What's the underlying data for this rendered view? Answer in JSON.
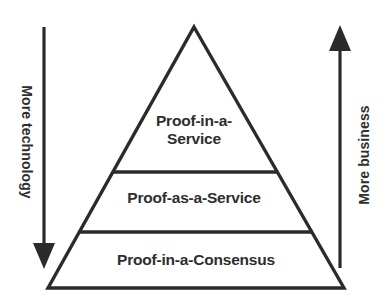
{
  "diagram": {
    "type": "pyramid",
    "background_color": "#ffffff",
    "stroke_color": "#2b2b2b",
    "text_color": "#2e2e2e",
    "tiers": [
      {
        "id": "top",
        "label": "Proof-in-a-\nService",
        "label_lines": [
          "Proof-in-a-",
          "Service"
        ],
        "level": 1
      },
      {
        "id": "middle",
        "label": "Proof-as-a-Service",
        "label_lines": [
          "Proof-as-a-Service"
        ],
        "level": 2
      },
      {
        "id": "bottom",
        "label": "Proof-in-a-Consensus",
        "label_lines": [
          "Proof-in-a-Consensus"
        ],
        "level": 3
      }
    ],
    "axes": [
      {
        "id": "left",
        "label": "More technology",
        "direction": "down",
        "arrow_icon": "arrow-down-icon"
      },
      {
        "id": "right",
        "label": "More business",
        "direction": "up",
        "arrow_icon": "arrow-up-icon"
      }
    ]
  }
}
